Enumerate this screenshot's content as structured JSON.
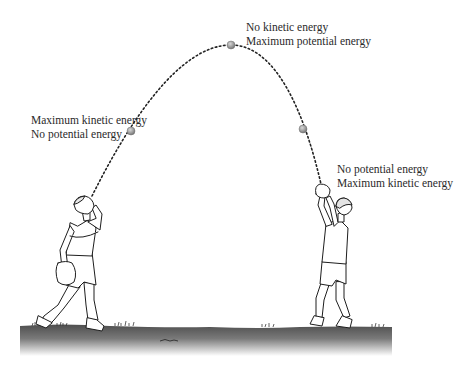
{
  "diagram": {
    "type": "projectile-energy",
    "ball_color": "#9a9a9a",
    "ground_color": "#5a5a5a",
    "trajectory": {
      "style": "dotted",
      "start": [
        92,
        196
      ],
      "apex": [
        231,
        45
      ],
      "end": [
        323,
        193
      ]
    },
    "balls": [
      {
        "name": "ball-rising",
        "x": 131,
        "y": 131
      },
      {
        "name": "ball-apex",
        "x": 231,
        "y": 45
      },
      {
        "name": "ball-falling",
        "x": 303,
        "y": 129
      }
    ],
    "labels": {
      "apex": {
        "line1": "No kinetic energy",
        "line2": "Maximum potential energy"
      },
      "launch": {
        "line1": "Maximum kinetic energy",
        "line2": "No potential energy"
      },
      "catch": {
        "line1": "No potential energy",
        "line2": "Maximum kinetic energy"
      }
    },
    "figures": [
      {
        "name": "thrower",
        "role": "person throwing ball"
      },
      {
        "name": "catcher",
        "role": "person catching ball"
      }
    ]
  }
}
